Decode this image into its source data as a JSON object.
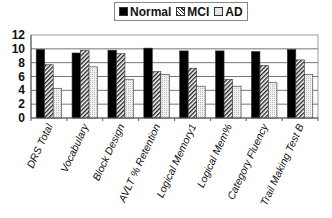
{
  "chart_data": {
    "type": "bar",
    "title": "",
    "xlabel": "",
    "ylabel": "",
    "ylim": [
      0,
      12
    ],
    "yticks": [
      0,
      2,
      4,
      6,
      8,
      10,
      12
    ],
    "grid": true,
    "legend_position": "top",
    "categories": [
      "DRS Total",
      "Vocabulary",
      "Block Design",
      "AVLT % Retention",
      "Logical Memory1",
      "Logical Mem%",
      "Category Fluency",
      "Trail Making Test B"
    ],
    "series": [
      {
        "name": "Normal",
        "pattern": "solid-black",
        "values": [
          9.9,
          9.4,
          9.8,
          10.1,
          9.7,
          9.7,
          9.6,
          9.9
        ]
      },
      {
        "name": "MCI",
        "pattern": "diagonal-hatch",
        "values": [
          7.7,
          9.8,
          9.3,
          6.7,
          7.2,
          5.6,
          7.6,
          8.4
        ]
      },
      {
        "name": "AD",
        "pattern": "dotted-light",
        "values": [
          4.3,
          7.4,
          5.6,
          6.3,
          4.6,
          4.6,
          5.1,
          6.3
        ]
      }
    ]
  },
  "legend": {
    "items": [
      {
        "label": "Normal",
        "color": "#000000"
      },
      {
        "label": "MCI",
        "color": "#555555"
      },
      {
        "label": "AD",
        "color": "#dddddd"
      }
    ]
  }
}
